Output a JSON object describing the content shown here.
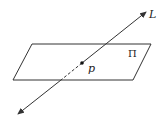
{
  "diagram": {
    "plane": {
      "label": "Π",
      "vertices": [
        [
          32,
          44
        ],
        [
          151,
          44
        ],
        [
          133,
          80
        ],
        [
          13,
          80
        ]
      ],
      "label_pos": [
        129,
        57
      ]
    },
    "line": {
      "label": "L",
      "start": [
        18,
        114
      ],
      "end": [
        146,
        12
      ],
      "label_pos": [
        149,
        18
      ],
      "hidden_segment": {
        "from": [
          61,
          80
        ],
        "to": [
          82,
          63
        ]
      }
    },
    "point": {
      "label": "p",
      "pos": [
        82,
        63
      ],
      "label_pos": [
        88,
        72
      ]
    },
    "stroke_color": "#333333"
  }
}
